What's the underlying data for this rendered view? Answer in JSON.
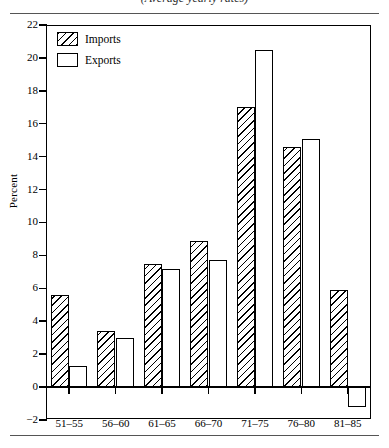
{
  "figure": {
    "title_remnant": "(Average yearly rates)",
    "y_axis_title": "Percent"
  },
  "legend": {
    "position": "top-left",
    "items": [
      {
        "label": "Imports",
        "swatch": "hatched-diagonal"
      },
      {
        "label": "Exports",
        "swatch": "open-white"
      }
    ]
  },
  "axes": {
    "y_ticks": [
      "22",
      "20",
      "18",
      "16",
      "14",
      "12",
      "10",
      "8",
      "6",
      "4",
      "2",
      "0",
      "-2"
    ],
    "x_ticks": [
      "51-55",
      "56-60",
      "61-65",
      "66-70",
      "71-75",
      "76-80",
      "81-85"
    ]
  },
  "chart_data": {
    "type": "bar",
    "title": "(Average yearly rates)",
    "xlabel": "",
    "ylabel": "Percent",
    "ylim": [
      -2,
      22
    ],
    "ytick_step": 2,
    "grid": false,
    "legend_position": "top-left",
    "categories": [
      "51-55",
      "56-60",
      "61-65",
      "66-70",
      "71-75",
      "76-80",
      "81-85"
    ],
    "series": [
      {
        "name": "Imports",
        "values": [
          5.6,
          3.4,
          7.5,
          8.9,
          17.0,
          14.6,
          5.9
        ]
      },
      {
        "name": "Exports",
        "values": [
          1.3,
          3.0,
          7.2,
          7.7,
          20.5,
          15.1,
          -1.2
        ]
      }
    ]
  }
}
